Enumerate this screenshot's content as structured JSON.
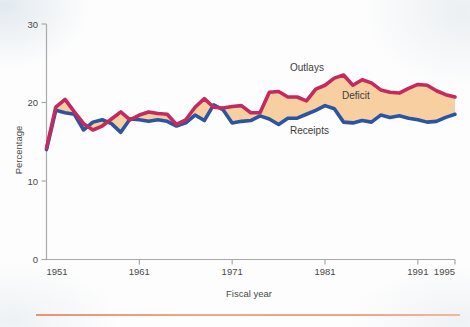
{
  "figure": {
    "name": "federal-outlays-receipts-deficit-chart",
    "background_color": "#fdfdfd"
  },
  "axes": {
    "x": {
      "title": "Fiscal year",
      "tick_labels": [
        "1951",
        "1961",
        "1971",
        "1981",
        "1991",
        "1995"
      ],
      "tick_values": [
        1951,
        1961,
        1971,
        1981,
        1991,
        1995
      ],
      "range": [
        1951,
        1995
      ]
    },
    "y": {
      "title": "Percentage",
      "tick_labels": [
        "0",
        "10",
        "20",
        "30"
      ],
      "tick_values": [
        0,
        10,
        20,
        30
      ],
      "range": [
        0,
        30
      ]
    },
    "axis_color": "#a8a8a8"
  },
  "annotations": {
    "outlays_label": "Outlays",
    "deficit_label": "Deficit",
    "receipts_label": "Receipts"
  },
  "colors": {
    "outlays_line": "#c42a5e",
    "receipts_line": "#2b55a0",
    "deficit_fill": "#f7cfa0",
    "surplus_fill": "#f7cfa0",
    "axis": "#a8a8a8",
    "text": "#434343",
    "bottom_rule": "#ef9f80"
  },
  "chart_data": {
    "type": "line",
    "title": "",
    "subtitle": "",
    "xlabel": "Fiscal year",
    "ylabel": "Percentage",
    "xlim": [
      1951,
      1995
    ],
    "ylim": [
      0,
      30
    ],
    "grid": false,
    "legend_position": "inline-annotations",
    "x": [
      1951,
      1952,
      1953,
      1954,
      1955,
      1956,
      1957,
      1958,
      1959,
      1960,
      1961,
      1962,
      1963,
      1964,
      1965,
      1966,
      1967,
      1968,
      1969,
      1970,
      1971,
      1972,
      1973,
      1974,
      1975,
      1976,
      1977,
      1978,
      1979,
      1980,
      1981,
      1982,
      1983,
      1984,
      1985,
      1986,
      1987,
      1988,
      1989,
      1990,
      1991,
      1992,
      1993,
      1994,
      1995
    ],
    "series": [
      {
        "name": "Outlays",
        "color": "#c42a5e",
        "values": [
          14.2,
          19.4,
          20.4,
          18.8,
          17.3,
          16.5,
          17.0,
          17.9,
          18.8,
          17.8,
          18.4,
          18.8,
          18.6,
          18.5,
          17.2,
          17.8,
          19.4,
          20.5,
          19.4,
          19.3,
          19.5,
          19.6,
          18.7,
          18.7,
          21.3,
          21.4,
          20.7,
          20.7,
          20.2,
          21.7,
          22.2,
          23.1,
          23.5,
          22.2,
          22.9,
          22.5,
          21.6,
          21.3,
          21.2,
          21.8,
          22.3,
          22.2,
          21.5,
          21.0,
          20.7
        ]
      },
      {
        "name": "Receipts",
        "color": "#2b55a0",
        "values": [
          14.0,
          19.0,
          18.7,
          18.5,
          16.5,
          17.5,
          17.8,
          17.3,
          16.2,
          17.9,
          17.8,
          17.6,
          17.8,
          17.6,
          17.0,
          17.4,
          18.4,
          17.7,
          19.7,
          19.1,
          17.4,
          17.6,
          17.7,
          18.3,
          17.9,
          17.2,
          18.0,
          18.0,
          18.5,
          19.0,
          19.6,
          19.2,
          17.5,
          17.4,
          17.7,
          17.5,
          18.4,
          18.1,
          18.3,
          18.0,
          17.8,
          17.5,
          17.6,
          18.1,
          18.5
        ]
      }
    ],
    "derived_region": {
      "name": "Deficit",
      "description": "Shaded area between Outlays (upper) and Receipts (lower)",
      "fill_color": "#f7cfa0"
    }
  }
}
